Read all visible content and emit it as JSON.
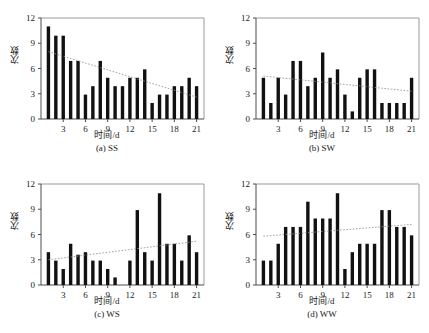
{
  "figure": {
    "panel_count": 4,
    "background_color": "#ffffff",
    "bar_color": "#111111",
    "trend_color": "#8a8a8a",
    "axis_color": "#4d4d4d"
  },
  "chart_data": [
    {
      "type": "bar",
      "panel_id": "a",
      "caption": "(a) SS",
      "title": "",
      "xlabel": "时间/d",
      "ylabel": "次数",
      "x": [
        1,
        2,
        3,
        4,
        5,
        6,
        7,
        8,
        9,
        10,
        11,
        12,
        13,
        14,
        15,
        16,
        17,
        18,
        19,
        20,
        21
      ],
      "values": [
        11,
        9.9,
        9.9,
        6.9,
        6.9,
        2.9,
        3.9,
        6.9,
        4.9,
        3.9,
        3.9,
        4.9,
        4.9,
        5.9,
        1.9,
        2.9,
        2.9,
        3.9,
        3.9,
        4.9,
        3.9
      ],
      "categories": [
        "1",
        "2",
        "3",
        "4",
        "5",
        "6",
        "7",
        "8",
        "9",
        "10",
        "11",
        "12",
        "13",
        "14",
        "15",
        "16",
        "17",
        "18",
        "19",
        "20",
        "21"
      ],
      "xticks": [
        3,
        6,
        9,
        12,
        15,
        18,
        21
      ],
      "xticklabels": [
        "3",
        "6",
        "9",
        "12",
        "15",
        "18",
        "21"
      ],
      "yticks": [
        0,
        3,
        6,
        9,
        12
      ],
      "yticklabels": [
        "0",
        "3",
        "6",
        "9",
        "12"
      ],
      "xlim": [
        0,
        22
      ],
      "ylim": [
        0,
        12
      ],
      "grid": false,
      "legend": "none",
      "trendline": {
        "style": "dotted",
        "y_start": 8.0,
        "y_end": 2.6
      }
    },
    {
      "type": "bar",
      "panel_id": "b",
      "caption": "(b) SW",
      "title": "",
      "xlabel": "时间/d",
      "ylabel": "次数",
      "x": [
        1,
        2,
        3,
        4,
        5,
        6,
        7,
        8,
        9,
        10,
        11,
        12,
        13,
        14,
        15,
        16,
        17,
        18,
        19,
        20,
        21
      ],
      "values": [
        4.9,
        1.9,
        4.9,
        2.9,
        6.9,
        6.9,
        3.9,
        4.9,
        7.9,
        4.9,
        5.9,
        2.9,
        0.9,
        4.9,
        5.9,
        5.9,
        1.9,
        1.9,
        1.9,
        1.9,
        4.9
      ],
      "categories": [
        "1",
        "2",
        "3",
        "4",
        "5",
        "6",
        "7",
        "8",
        "9",
        "10",
        "11",
        "12",
        "13",
        "14",
        "15",
        "16",
        "17",
        "18",
        "19",
        "20",
        "21"
      ],
      "xticks": [
        3,
        6,
        9,
        12,
        15,
        18,
        21
      ],
      "xticklabels": [
        "3",
        "6",
        "9",
        "12",
        "15",
        "18",
        "21"
      ],
      "yticks": [
        0,
        3,
        6,
        9,
        12
      ],
      "yticklabels": [
        "0",
        "3",
        "6",
        "9",
        "12"
      ],
      "xlim": [
        0,
        22
      ],
      "ylim": [
        0,
        12
      ],
      "grid": false,
      "legend": "none",
      "trendline": {
        "style": "dotted",
        "y_start": 5.1,
        "y_end": 3.3
      }
    },
    {
      "type": "bar",
      "panel_id": "c",
      "caption": "(c) WS",
      "title": "",
      "xlabel": "时间/d",
      "ylabel": "次数",
      "x": [
        1,
        2,
        3,
        4,
        5,
        6,
        7,
        8,
        9,
        10,
        11,
        12,
        13,
        14,
        15,
        16,
        17,
        18,
        19,
        20,
        21
      ],
      "values": [
        3.9,
        2.9,
        1.9,
        4.9,
        3.6,
        3.9,
        2.9,
        2.9,
        1.9,
        0.9,
        0,
        2.9,
        8.9,
        3.9,
        2.9,
        10.9,
        4.9,
        4.9,
        2.9,
        5.9,
        3.9
      ],
      "categories": [
        "1",
        "2",
        "3",
        "4",
        "5",
        "6",
        "7",
        "8",
        "9",
        "10",
        "11",
        "12",
        "13",
        "14",
        "15",
        "16",
        "17",
        "18",
        "19",
        "20",
        "21"
      ],
      "xticks": [
        3,
        6,
        9,
        12,
        15,
        18,
        21
      ],
      "xticklabels": [
        "3",
        "6",
        "9",
        "12",
        "15",
        "18",
        "21"
      ],
      "yticks": [
        0,
        3,
        6,
        9,
        12
      ],
      "yticklabels": [
        "0",
        "3",
        "6",
        "9",
        "12"
      ],
      "xlim": [
        0,
        22
      ],
      "ylim": [
        0,
        12
      ],
      "grid": false,
      "legend": "none",
      "trendline": {
        "style": "dotted",
        "y_start": 3.0,
        "y_end": 5.2
      }
    },
    {
      "type": "bar",
      "panel_id": "d",
      "caption": "(d) WW",
      "title": "",
      "xlabel": "时间/d",
      "ylabel": "次数",
      "x": [
        1,
        2,
        3,
        4,
        5,
        6,
        7,
        8,
        9,
        10,
        11,
        12,
        13,
        14,
        15,
        16,
        17,
        18,
        19,
        20,
        21
      ],
      "values": [
        2.9,
        2.9,
        4.9,
        6.9,
        6.9,
        6.9,
        9.9,
        7.9,
        7.9,
        7.9,
        10.9,
        1.9,
        3.9,
        4.9,
        4.9,
        4.9,
        8.9,
        8.9,
        6.9,
        6.9,
        5.9
      ],
      "categories": [
        "1",
        "2",
        "3",
        "4",
        "5",
        "6",
        "7",
        "8",
        "9",
        "10",
        "11",
        "12",
        "13",
        "14",
        "15",
        "16",
        "17",
        "18",
        "19",
        "20",
        "21"
      ],
      "xticks": [
        3,
        6,
        9,
        12,
        15,
        18,
        21
      ],
      "xticklabels": [
        "3",
        "6",
        "9",
        "12",
        "15",
        "18",
        "21"
      ],
      "yticks": [
        0,
        3,
        6,
        9,
        12
      ],
      "yticklabels": [
        "0",
        "3",
        "6",
        "9",
        "12"
      ],
      "xlim": [
        0,
        22
      ],
      "ylim": [
        0,
        12
      ],
      "grid": false,
      "legend": "none",
      "trendline": {
        "style": "dotted",
        "y_start": 5.8,
        "y_end": 7.2
      }
    }
  ]
}
